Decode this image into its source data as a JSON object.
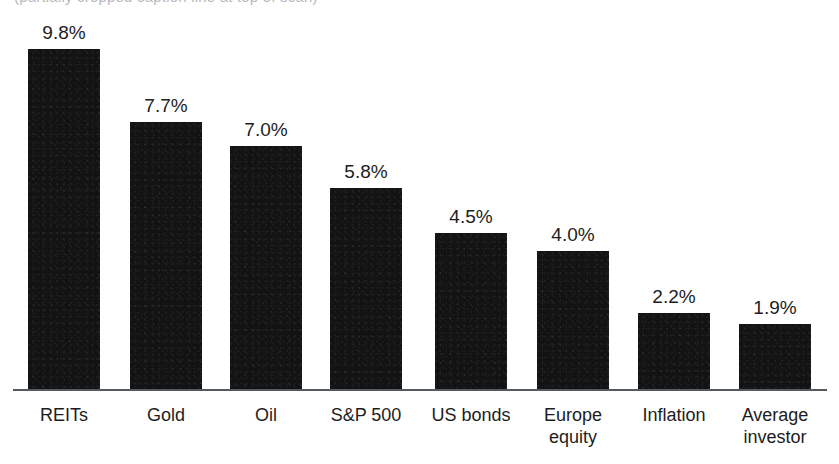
{
  "cropped_caption": {
    "text": "(partially cropped caption line at top of scan)"
  },
  "chart_data": {
    "type": "bar",
    "title": "",
    "subtitle": "",
    "xlabel": "",
    "ylabel": "",
    "grid": false,
    "legend": "none",
    "value_suffix": "%",
    "ylim": [
      0,
      9.8
    ],
    "axis": {
      "baseline_visible": true,
      "y_axis_visible": false,
      "tick_labels": []
    },
    "categories": [
      "REITs",
      "Gold",
      "Oil",
      "S&P 500",
      "US bonds",
      "Europe equity",
      "Inflation",
      "Average investor"
    ],
    "category_lines": [
      [
        "REITs"
      ],
      [
        "Gold"
      ],
      [
        "Oil"
      ],
      [
        "S&P 500"
      ],
      [
        "US bonds"
      ],
      [
        "Europe",
        "equity"
      ],
      [
        "Inflation"
      ],
      [
        "Average",
        "investor"
      ]
    ],
    "values": [
      9.8,
      7.7,
      7.0,
      5.8,
      4.5,
      4.0,
      2.2,
      1.9
    ],
    "value_labels": [
      "9.8%",
      "7.7%",
      "7.0%",
      "5.8%",
      "4.5%",
      "4.0%",
      "2.2%",
      "1.9%"
    ],
    "bar_color": "#131313",
    "axis_color": "#555a5e",
    "text_color": "#1d1d1d",
    "background_color": "#ffffff",
    "geometry": {
      "baseline_y": 390,
      "px_per_unit": 34.8,
      "bar_width": 72,
      "bar_left_positions": [
        28,
        130,
        230,
        330,
        435,
        537,
        638,
        739
      ]
    }
  }
}
